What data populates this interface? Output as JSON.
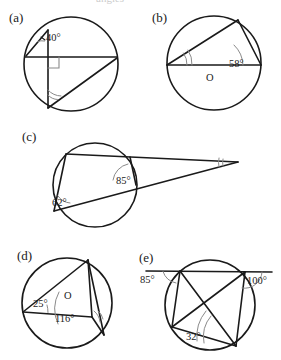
{
  "page": {
    "width": 281,
    "height": 360,
    "background": "#ffffff",
    "ink": "#1a1a1a",
    "arc_color": "#8a8a8a",
    "cropped_header_text": "angles"
  },
  "figure": {
    "kind": "geometry-figure",
    "panel_count": 5
  },
  "panels": [
    {
      "id": "a",
      "label": "(a)",
      "description": "Circle with a horizontal chord, a vertical chord meeting it at a right angle, a short chord at upper left marked 40 degrees, and a diagonal chord; the angle at the lower vertex is unknown.",
      "circle": {
        "cx": 71,
        "cy": 64,
        "r": 47
      },
      "angles": [
        {
          "name": "angle-40",
          "value": "40°",
          "x": 46,
          "y": 41
        }
      ],
      "markers": [
        "right-angle-square",
        "double-arc-unknown"
      ]
    },
    {
      "id": "b",
      "label": "(b)",
      "description": "Circle with a horizontal diameter through centre O and an inscribed triangle whose right base angle is 58 degrees and whose left base angle is unknown.",
      "circle": {
        "cx": 214,
        "cy": 63,
        "r": 47
      },
      "centre_label": "O",
      "centre_label_pos": {
        "x": 210,
        "y": 80
      },
      "angles": [
        {
          "name": "angle-58",
          "value": "58°",
          "x": 229,
          "y": 67
        }
      ],
      "markers": [
        "double-arc-unknown"
      ]
    },
    {
      "id": "c",
      "label": "(c)",
      "description": "Two secants drawn from an external point on the right meeting a circle; the angle at the lower-left circle point is 62 degrees, the angle at the upper-right intersection is 85 degrees, and the angle at the external point is unknown.",
      "circle": {
        "cx": 95,
        "cy": 185,
        "r": 42
      },
      "angles": [
        {
          "name": "angle-62",
          "value": "62°",
          "x": 57,
          "y": 202
        },
        {
          "name": "angle-85",
          "value": "85°",
          "x": 124,
          "y": 180
        }
      ],
      "markers": [
        "double-arc-unknown-external"
      ]
    },
    {
      "id": "d",
      "label": "(d)",
      "description": "Circle with centre O; the inscribed angle at the left vertex is 25 degrees, the reflex-side central angle is 116 degrees, and the angle at the lower-right vertex is unknown.",
      "circle": {
        "cx": 67,
        "cy": 303,
        "r": 45
      },
      "centre_label": "O",
      "centre_label_pos": {
        "x": 67,
        "y": 298
      },
      "angles": [
        {
          "name": "angle-25",
          "value": "25°",
          "x": 42,
          "y": 303
        },
        {
          "name": "angle-116",
          "value": "116°",
          "x": 62,
          "y": 317
        }
      ],
      "markers": [
        "double-arc-unknown"
      ]
    },
    {
      "id": "e",
      "label": "(e)",
      "description": "Cyclic quadrilateral with a line extended through the top two vertices; exterior angle on the left is 85 degrees, exterior angle on the right is 100 degrees, and the angle at the bottom vertex is 32 degrees.",
      "circle": {
        "cx": 210,
        "cy": 305,
        "r": 45
      },
      "angles": [
        {
          "name": "angle-85",
          "value": "85°",
          "x": 148,
          "y": 277
        },
        {
          "name": "angle-100",
          "value": "100°",
          "x": 250,
          "y": 279
        },
        {
          "name": "angle-32",
          "value": "32°",
          "x": 194,
          "y": 335
        }
      ],
      "markers": [
        "arc-85",
        "arc-100",
        "arc-32"
      ]
    }
  ]
}
